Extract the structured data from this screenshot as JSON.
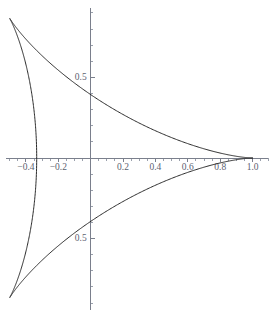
{
  "figure": {
    "width": 272,
    "height": 316,
    "background": "#ffffff",
    "curve_color": "#2b2b2b",
    "axis_color": "#7a7f8c",
    "label_color": "#5c6270"
  },
  "chart_data": {
    "type": "line",
    "title": "",
    "subtitle": "",
    "xlabel": "",
    "ylabel": "",
    "grid": false,
    "legend": false,
    "curve_name": "deltoid",
    "parametric": {
      "x": "(2*cos(t) + cos(2*t))/3",
      "y": "(2*sin(t) - sin(2*t))/3",
      "t_range": [
        0,
        6.283185307179586
      ]
    },
    "xlim": [
      -0.56,
      1.12
    ],
    "ylim": [
      -0.98,
      0.98
    ],
    "xticks": [
      -0.4,
      -0.2,
      0.2,
      0.4,
      0.6,
      0.8,
      1.0
    ],
    "xtick_labels": [
      "-0.4",
      "-0.2",
      "0.2",
      "0.4",
      "0.6",
      "0.8",
      "1.0"
    ],
    "yticks": [
      0.5,
      -0.5
    ],
    "ytick_labels": [
      "0.5",
      "0.5"
    ],
    "x_minor_step": 0.05,
    "y_minor_step": 0.1,
    "cusps": [
      {
        "x": 1.0,
        "y": 0.0,
        "label": "right-cusp"
      },
      {
        "x": -0.5,
        "y": 0.866,
        "label": "upper-left-cusp"
      },
      {
        "x": -0.5,
        "y": -0.866,
        "label": "lower-left-cusp"
      }
    ],
    "y_axis_crossings": [
      0.3333,
      -0.3333
    ],
    "x_axis_crossings": [
      -0.3333,
      1.0
    ],
    "points": [
      {
        "x": 1.0,
        "y": 0.0
      },
      {
        "x": 0.9933,
        "y": 0.0221
      },
      {
        "x": 0.9736,
        "y": 0.0627
      },
      {
        "x": 0.9417,
        "y": 0.1157
      },
      {
        "x": 0.8987,
        "y": 0.1767
      },
      {
        "x": 0.8461,
        "y": 0.2425
      },
      {
        "x": 0.7855,
        "y": 0.3105
      },
      {
        "x": 0.7186,
        "y": 0.3787
      },
      {
        "x": 0.6472,
        "y": 0.4452
      },
      {
        "x": 0.573,
        "y": 0.5087
      },
      {
        "x": 0.4978,
        "y": 0.568
      },
      {
        "x": 0.4231,
        "y": 0.6222
      },
      {
        "x": 0.3503,
        "y": 0.6703
      },
      {
        "x": 0.2806,
        "y": 0.7119
      },
      {
        "x": 0.215,
        "y": 0.7465
      },
      {
        "x": 0.1542,
        "y": 0.7739
      },
      {
        "x": 0.0988,
        "y": 0.7939
      },
      {
        "x": 0.049,
        "y": 0.8065
      },
      {
        "x": 0.005,
        "y": 0.812
      },
      {
        "x": -0.0334,
        "y": 0.8107
      },
      {
        "x": -0.0665,
        "y": 0.8029
      },
      {
        "x": -0.0947,
        "y": 0.7893
      },
      {
        "x": -0.1186,
        "y": 0.7703
      },
      {
        "x": -0.1387,
        "y": 0.7468
      },
      {
        "x": -0.1557,
        "y": 0.7194
      },
      {
        "x": -0.1702,
        "y": 0.6889
      },
      {
        "x": -0.1829,
        "y": 0.656
      },
      {
        "x": -0.1944,
        "y": 0.6215
      },
      {
        "x": -0.2053,
        "y": 0.5861
      },
      {
        "x": -0.2162,
        "y": 0.5506
      },
      {
        "x": -0.2277,
        "y": 0.5157
      },
      {
        "x": -0.2404,
        "y": 0.4819
      },
      {
        "x": -0.2547,
        "y": 0.45
      },
      {
        "x": -0.2711,
        "y": 0.4205
      },
      {
        "x": -0.29,
        "y": 0.3938
      },
      {
        "x": -0.3117,
        "y": 0.3704
      },
      {
        "x": -0.3364,
        "y": 0.3506
      },
      {
        "x": -0.3642,
        "y": 0.3347
      },
      {
        "x": -0.3952,
        "y": 0.3228
      },
      {
        "x": -0.4292,
        "y": 0.3151
      },
      {
        "x": -0.466,
        "y": 0.3114
      },
      {
        "x": -0.5,
        "y": 0.866
      },
      {
        "x": -0.5,
        "y": -0.866
      },
      {
        "x": -0.466,
        "y": -0.3114
      },
      {
        "x": -0.3952,
        "y": -0.3228
      },
      {
        "x": -0.3117,
        "y": -0.3704
      },
      {
        "x": -0.2404,
        "y": -0.4819
      },
      {
        "x": -0.1944,
        "y": -0.6215
      },
      {
        "x": -0.1557,
        "y": -0.7194
      },
      {
        "x": -0.0947,
        "y": -0.7893
      },
      {
        "x": 0.005,
        "y": -0.812
      },
      {
        "x": 0.1542,
        "y": -0.7739
      },
      {
        "x": 0.3503,
        "y": -0.6703
      },
      {
        "x": 0.573,
        "y": -0.5087
      },
      {
        "x": 0.7855,
        "y": -0.3105
      },
      {
        "x": 0.9417,
        "y": -0.1157
      },
      {
        "x": 1.0,
        "y": 0.0
      }
    ]
  }
}
